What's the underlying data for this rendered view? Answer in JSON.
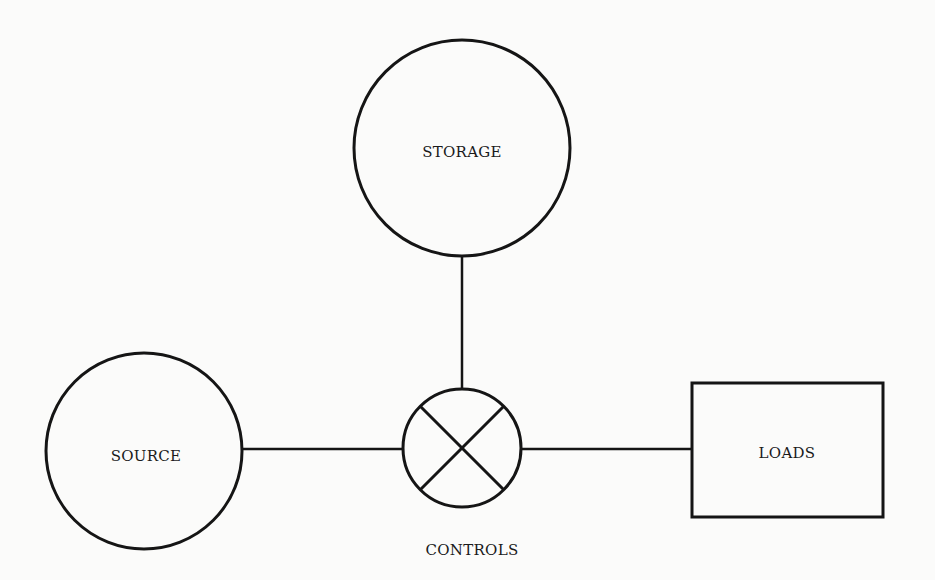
{
  "diagram": {
    "type": "block-diagram",
    "nodes": {
      "storage": {
        "label": "STORAGE",
        "shape": "circle"
      },
      "source": {
        "label": "SOURCE",
        "shape": "circle"
      },
      "controls": {
        "label": "CONTROLS",
        "shape": "circle-with-x"
      },
      "loads": {
        "label": "LOADS",
        "shape": "rectangle"
      }
    },
    "edges": [
      {
        "from": "storage",
        "to": "controls"
      },
      {
        "from": "source",
        "to": "controls"
      },
      {
        "from": "controls",
        "to": "loads"
      }
    ],
    "colors": {
      "stroke": "#151515",
      "background": "#fbfbfa",
      "text": "#1a1a1a"
    }
  }
}
